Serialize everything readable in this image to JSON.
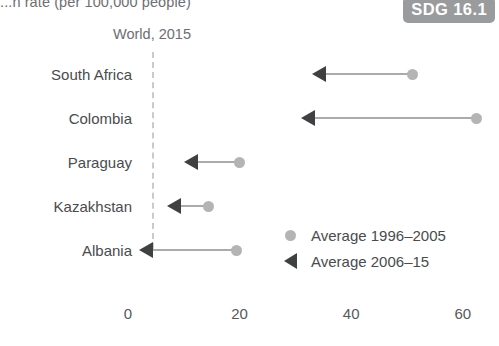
{
  "chart": {
    "axis_title": "...n rate (per 100,000 people)",
    "reference_label": "World, 2015",
    "badge": "SDG 16.1"
  },
  "legend": {
    "items": [
      {
        "label": "Average 1996–2005",
        "marker": "circle-marker",
        "color": "#b3b4b6"
      },
      {
        "label": "Average 2006–15",
        "marker": "left-arrow-marker",
        "color": "#3f4041"
      }
    ]
  },
  "xaxis": {
    "ticks": [
      "0",
      "20",
      "40",
      "60"
    ]
  },
  "chart_data": {
    "type": "bar",
    "subtype": "arrow-plot",
    "title": "...n rate (per 100,000 people)",
    "xlabel": "",
    "ylabel": "",
    "xlim": [
      0,
      62
    ],
    "grid": false,
    "legend_position": "inside-right",
    "categories": [
      "South Africa",
      "Colombia",
      "Paraguay",
      "Kazakhstan",
      "Albania"
    ],
    "series": [
      {
        "name": "Average 1996–2005",
        "values": [
          51,
          62.5,
          20,
          14.5,
          19.5
        ]
      },
      {
        "name": "Average 2006–15",
        "values": [
          33,
          31,
          10,
          7,
          2
        ]
      }
    ],
    "annotations": [
      {
        "text": "World, 2015",
        "type": "reference-line",
        "x": 4.3
      },
      {
        "text": "SDG 16.1",
        "type": "badge"
      }
    ]
  }
}
